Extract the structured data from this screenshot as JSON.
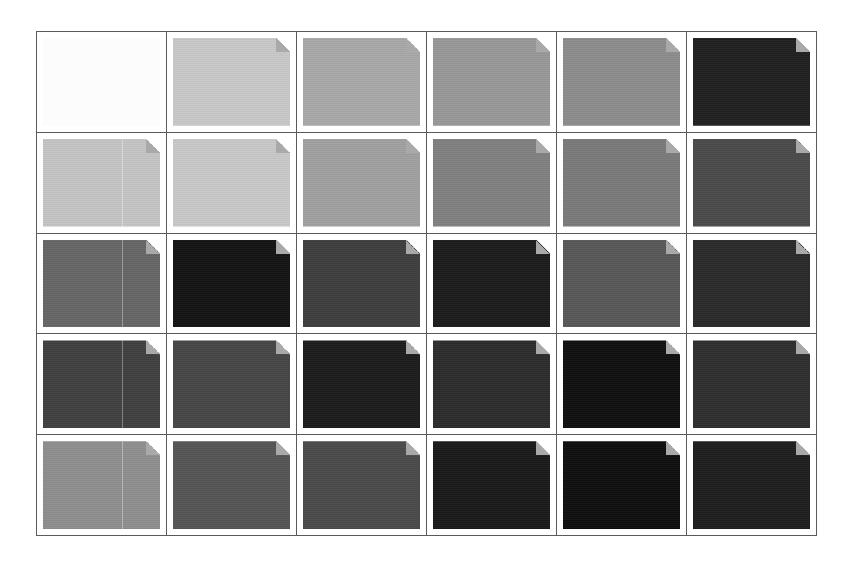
{
  "grid": {
    "columns": 6,
    "rows": 5,
    "border_color": "#5a5a5a",
    "fold_color": "#a9a9a9",
    "cells": [
      {
        "row": 1,
        "col": 1,
        "type": "empty",
        "color": "#fcfcfc",
        "split": false
      },
      {
        "row": 1,
        "col": 2,
        "type": "document-thumbnail",
        "color": "#c8c8c8",
        "split": false
      },
      {
        "row": 1,
        "col": 3,
        "type": "document-thumbnail",
        "color": "#a8a8a8",
        "split": false
      },
      {
        "row": 1,
        "col": 4,
        "type": "document-thumbnail",
        "color": "#989898",
        "split": false
      },
      {
        "row": 1,
        "col": 5,
        "type": "document-thumbnail",
        "color": "#8c8c8c",
        "split": false
      },
      {
        "row": 1,
        "col": 6,
        "type": "document-thumbnail",
        "color": "#202020",
        "split": false
      },
      {
        "row": 2,
        "col": 1,
        "type": "document-thumbnail",
        "color": "#c4c4c4",
        "split": true
      },
      {
        "row": 2,
        "col": 2,
        "type": "document-thumbnail",
        "color": "#c8c8c8",
        "split": false
      },
      {
        "row": 2,
        "col": 3,
        "type": "document-thumbnail",
        "color": "#a0a0a0",
        "split": false
      },
      {
        "row": 2,
        "col": 4,
        "type": "document-thumbnail",
        "color": "#808080",
        "split": false
      },
      {
        "row": 2,
        "col": 5,
        "type": "document-thumbnail",
        "color": "#7a7a7a",
        "split": false
      },
      {
        "row": 2,
        "col": 6,
        "type": "document-thumbnail",
        "color": "#4a4a4a",
        "split": false
      },
      {
        "row": 3,
        "col": 1,
        "type": "document-thumbnail",
        "color": "#666666",
        "split": true
      },
      {
        "row": 3,
        "col": 2,
        "type": "document-thumbnail",
        "color": "#141414",
        "split": false
      },
      {
        "row": 3,
        "col": 3,
        "type": "document-thumbnail",
        "color": "#3e3e3e",
        "split": false
      },
      {
        "row": 3,
        "col": 4,
        "type": "document-thumbnail",
        "color": "#1c1c1c",
        "split": false
      },
      {
        "row": 3,
        "col": 5,
        "type": "document-thumbnail",
        "color": "#585858",
        "split": false
      },
      {
        "row": 3,
        "col": 6,
        "type": "document-thumbnail",
        "color": "#2a2a2a",
        "split": false
      },
      {
        "row": 4,
        "col": 1,
        "type": "document-thumbnail",
        "color": "#404040",
        "split": true
      },
      {
        "row": 4,
        "col": 2,
        "type": "document-thumbnail",
        "color": "#464646",
        "split": false
      },
      {
        "row": 4,
        "col": 3,
        "type": "document-thumbnail",
        "color": "#1c1c1c",
        "split": false
      },
      {
        "row": 4,
        "col": 4,
        "type": "document-thumbnail",
        "color": "#2c2c2c",
        "split": false
      },
      {
        "row": 4,
        "col": 5,
        "type": "document-thumbnail",
        "color": "#101010",
        "split": false
      },
      {
        "row": 4,
        "col": 6,
        "type": "document-thumbnail",
        "color": "#2e2e2e",
        "split": false
      },
      {
        "row": 5,
        "col": 1,
        "type": "document-thumbnail",
        "color": "#8e8e8e",
        "split": true
      },
      {
        "row": 5,
        "col": 2,
        "type": "document-thumbnail",
        "color": "#555555",
        "split": false
      },
      {
        "row": 5,
        "col": 3,
        "type": "document-thumbnail",
        "color": "#4a4a4a",
        "split": false
      },
      {
        "row": 5,
        "col": 4,
        "type": "document-thumbnail",
        "color": "#1a1a1a",
        "split": false
      },
      {
        "row": 5,
        "col": 5,
        "type": "document-thumbnail",
        "color": "#0e0e0e",
        "split": false
      },
      {
        "row": 5,
        "col": 6,
        "type": "document-thumbnail",
        "color": "#1e1e1e",
        "split": false
      }
    ]
  }
}
